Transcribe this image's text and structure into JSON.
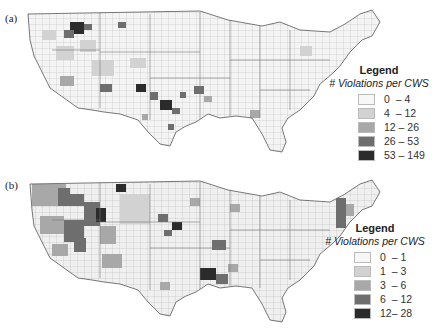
{
  "figure": {
    "panels": [
      {
        "label": "(a)",
        "legend": {
          "title": "Legend",
          "subtitle": "# Violations per CWS",
          "classes": [
            {
              "range": "0  – 4",
              "color": "#f7f7f7"
            },
            {
              "range": "4  – 12",
              "color": "#d2d2d2"
            },
            {
              "range": "12 – 26",
              "color": "#a8a8a8"
            },
            {
              "range": "26 – 53",
              "color": "#6e6e6e"
            },
            {
              "range": "53 – 149",
              "color": "#2b2b2b"
            }
          ]
        }
      },
      {
        "label": "(b)",
        "legend": {
          "title": "Legend",
          "subtitle": "# Violations per CWS",
          "classes": [
            {
              "range": "0  – 1",
              "color": "#f7f7f7"
            },
            {
              "range": "1  – 3",
              "color": "#d2d2d2"
            },
            {
              "range": "3  – 6",
              "color": "#a8a8a8"
            },
            {
              "range": "6  – 12",
              "color": "#6e6e6e"
            },
            {
              "range": "12– 28",
              "color": "#2b2b2b"
            }
          ]
        }
      }
    ]
  },
  "colors": {
    "outline": "#555555",
    "county_line": "#999999",
    "background": "#ffffff"
  }
}
